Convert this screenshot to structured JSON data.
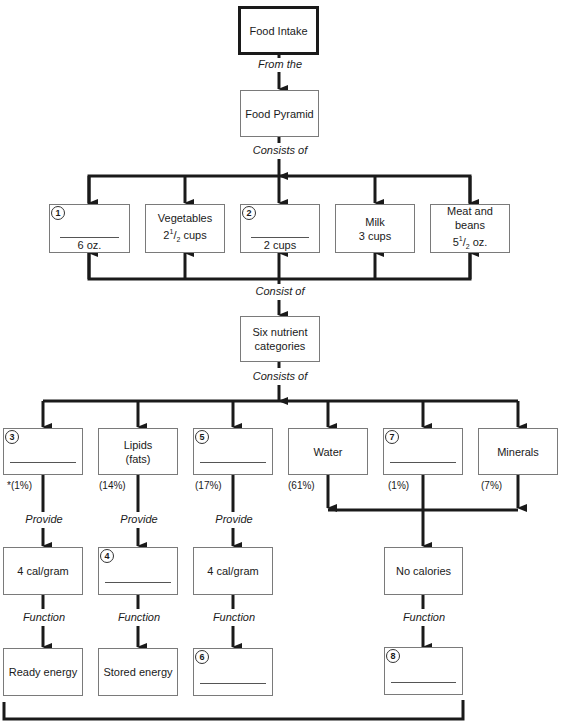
{
  "diagram": {
    "top": {
      "food_intake": "Food Intake",
      "from_the": "From the",
      "food_pyramid": "Food Pyramid",
      "consists_of_1": "Consists of"
    },
    "food_groups": [
      {
        "number": "1",
        "name": "",
        "amount": "6 oz.",
        "blank": true
      },
      {
        "number": "",
        "name": "Vegetables",
        "amount_whole": "2",
        "amount_frac_num": "1",
        "amount_frac_den": "2",
        "amount_unit": "cups"
      },
      {
        "number": "2",
        "name": "",
        "amount": "2 cups",
        "blank": true
      },
      {
        "number": "",
        "name": "Milk",
        "amount": "3 cups"
      },
      {
        "number": "",
        "name": "Meat and beans",
        "amount_whole": "5",
        "amount_frac_num": "1",
        "amount_frac_den": "2",
        "amount_unit": "oz."
      }
    ],
    "consist_of": "Consist of",
    "six_nutrient": {
      "line1": "Six nutrient",
      "line2": "categories"
    },
    "consists_of_2": "Consists of",
    "nutrients": [
      {
        "number": "3",
        "name": "",
        "blank": true,
        "percent": "*(1%)"
      },
      {
        "number": "",
        "name_line1": "Lipids",
        "name_line2": "(fats)",
        "percent": "(14%)"
      },
      {
        "number": "5",
        "name": "",
        "blank": true,
        "percent": "(17%)"
      },
      {
        "number": "",
        "name": "Water",
        "percent": "(61%)"
      },
      {
        "number": "7",
        "name": "",
        "blank": true,
        "percent": "(1%)"
      },
      {
        "number": "",
        "name": "Minerals",
        "percent": "(7%)"
      }
    ],
    "provide_label": "Provide",
    "function_label": "Function",
    "calories": [
      {
        "text": "4 cal/gram"
      },
      {
        "number": "4",
        "blank": true
      },
      {
        "text": "4 cal/gram"
      },
      {
        "text": "No calories"
      }
    ],
    "functions": [
      {
        "text": "Ready energy"
      },
      {
        "text": "Stored energy"
      },
      {
        "number": "6",
        "blank": true
      },
      {
        "number": "8",
        "blank": true
      }
    ]
  }
}
